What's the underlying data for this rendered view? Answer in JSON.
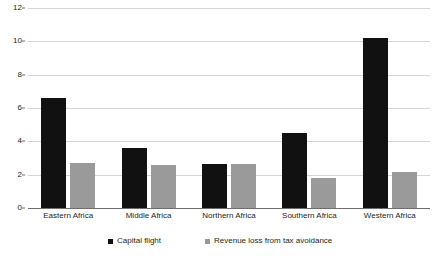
{
  "chart_data": {
    "type": "bar",
    "title": "",
    "subtitle": "",
    "xlabel": "",
    "ylabel": "",
    "ylim": [
      0,
      12
    ],
    "yticks": [
      0,
      2,
      4,
      6,
      8,
      10,
      12
    ],
    "ytick_labels": [
      "0",
      "2",
      "4",
      "6",
      "8",
      "10",
      "12"
    ],
    "grid": true,
    "legend_position": "bottom",
    "categories": [
      "Eastern Africa",
      "Middle Africa",
      "Northern Africa",
      "Southern Africa",
      "Western Africa"
    ],
    "series": [
      {
        "name": "Capital flight",
        "color": "#111111",
        "values": [
          6.6,
          3.6,
          2.65,
          4.5,
          10.2
        ]
      },
      {
        "name": "Revenue loss from tax avoidance",
        "color": "#9a9a9a",
        "values": [
          2.7,
          2.6,
          2.65,
          1.8,
          2.15
        ]
      }
    ]
  },
  "axis": {
    "gridline_color": "#d4d4d4",
    "baseline_color": "#6e6e6e"
  }
}
